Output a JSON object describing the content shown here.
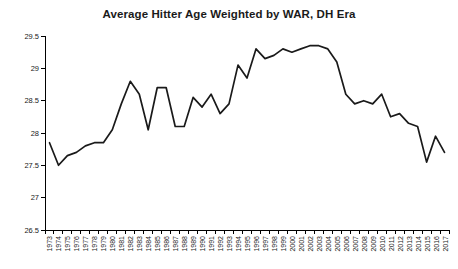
{
  "page": {
    "title": "Average Hitter Age Weighted by WAR, DH Era"
  },
  "colors": {
    "line": "#1a1a1a",
    "text": "#1a1a1a",
    "axis": "#000000",
    "background": "#ffffff"
  },
  "chart_data": {
    "type": "line",
    "title": "Average Hitter Age Weighted by WAR, DH Era",
    "xlabel": "",
    "ylabel": "",
    "grid": false,
    "legend": "none",
    "ylim": [
      26.5,
      29.5
    ],
    "yticks": [
      26.5,
      27,
      27.5,
      28,
      28.5,
      29,
      29.5
    ],
    "ytick_labels": [
      "26.5",
      "27",
      "27.5",
      "28",
      "28.5",
      "29",
      "29.5"
    ],
    "x": [
      1973,
      1974,
      1975,
      1976,
      1977,
      1978,
      1979,
      1980,
      1981,
      1982,
      1983,
      1984,
      1985,
      1986,
      1987,
      1988,
      1989,
      1990,
      1991,
      1992,
      1993,
      1994,
      1995,
      1996,
      1997,
      1998,
      1999,
      2000,
      2001,
      2002,
      2003,
      2004,
      2005,
      2006,
      2007,
      2008,
      2009,
      2010,
      2011,
      2012,
      2013,
      2014,
      2015,
      2016,
      2017
    ],
    "values": [
      27.85,
      27.5,
      27.65,
      27.7,
      27.8,
      27.85,
      27.85,
      28.05,
      28.45,
      28.8,
      28.6,
      28.05,
      28.7,
      28.7,
      28.1,
      28.1,
      28.55,
      28.4,
      28.6,
      28.3,
      28.45,
      29.05,
      28.85,
      29.3,
      29.15,
      29.2,
      29.3,
      29.25,
      29.3,
      29.35,
      29.35,
      29.3,
      29.1,
      28.6,
      28.45,
      28.5,
      28.45,
      28.6,
      28.25,
      28.3,
      28.15,
      28.1,
      27.55,
      27.95,
      27.7
    ]
  }
}
